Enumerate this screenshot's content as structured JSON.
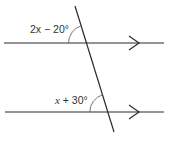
{
  "diagram": {
    "type": "parallel-lines-transversal",
    "colors": {
      "line": "#2b2b2b",
      "arc": "#555555",
      "text": "#333333",
      "background": "#ffffff"
    },
    "lines": {
      "top_parallel": {
        "y": 43,
        "x1": 4,
        "x2": 164,
        "arrow_x": 139
      },
      "bottom_parallel": {
        "y": 112,
        "x1": 5,
        "x2": 164,
        "arrow_x": 139
      },
      "transversal": {
        "x1": 75,
        "y1": 6,
        "x2": 114,
        "y2": 132
      }
    },
    "angles": [
      {
        "id": "upper",
        "label_var": "2x",
        "label_rest": " − 20°",
        "position": "upper-left at top intersection"
      },
      {
        "id": "lower",
        "label_var": "x",
        "label_rest": " + 30°",
        "position": "upper-left at bottom intersection"
      }
    ]
  }
}
